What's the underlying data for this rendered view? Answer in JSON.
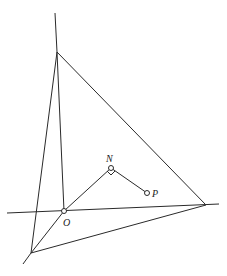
{
  "diagram": {
    "type": "geometry",
    "stroke_color": "#2a2a2a",
    "background": "#ffffff",
    "points": {
      "A": {
        "x": 57,
        "y": 52,
        "label": ""
      },
      "B": {
        "x": 206,
        "y": 205,
        "label": ""
      },
      "C": {
        "x": 31,
        "y": 253,
        "label": ""
      },
      "O": {
        "x": 64,
        "y": 211,
        "label": "O"
      },
      "N": {
        "x": 111,
        "y": 168,
        "label": "N"
      },
      "P": {
        "x": 147,
        "y": 193,
        "label": "P"
      }
    },
    "labels": {
      "O": "O",
      "N": "N",
      "P": "P"
    }
  }
}
